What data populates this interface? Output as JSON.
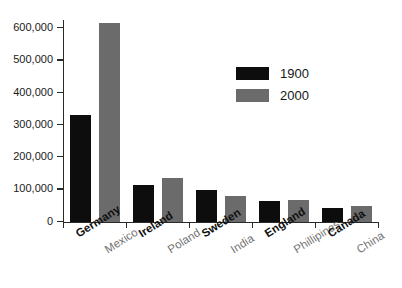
{
  "chart_data": {
    "type": "bar",
    "title": "",
    "subtitle": "",
    "xlabel": "",
    "ylabel": "",
    "ylim": [
      0,
      620000
    ],
    "yticks": [
      0,
      100000,
      200000,
      300000,
      400000,
      500000,
      600000
    ],
    "ytick_labels": [
      "0",
      "100,000",
      "200,000",
      "300,000",
      "400,000",
      "500,000",
      "600,000"
    ],
    "grid": false,
    "legend_position": "upper-center-right",
    "group_count": 5,
    "series": [
      {
        "name": "1900",
        "color": "#0d0d0d",
        "categories": [
          "Germany",
          "Ireland",
          "Sweden",
          "England",
          "Canada"
        ],
        "values": [
          333000,
          114000,
          99000,
          66000,
          42000
        ]
      },
      {
        "name": "2000",
        "color": "#6b6b6b",
        "categories": [
          "Mexico",
          "Poland",
          "India",
          "Phillipines",
          "China"
        ],
        "values": [
          618000,
          137000,
          82000,
          67000,
          50000
        ]
      }
    ],
    "bars": [
      {
        "label": "Germany",
        "series": "1900",
        "value": 333000
      },
      {
        "label": "Mexico",
        "series": "2000",
        "value": 618000
      },
      {
        "label": "Ireland",
        "series": "1900",
        "value": 114000
      },
      {
        "label": "Poland",
        "series": "2000",
        "value": 137000
      },
      {
        "label": "Sweden",
        "series": "1900",
        "value": 99000
      },
      {
        "label": "India",
        "series": "2000",
        "value": 82000
      },
      {
        "label": "England",
        "series": "1900",
        "value": 66000
      },
      {
        "label": "Phillipines",
        "series": "2000",
        "value": 67000
      },
      {
        "label": "Canada",
        "series": "1900",
        "value": 42000
      },
      {
        "label": "China",
        "series": "2000",
        "value": 50000
      }
    ]
  },
  "legend": {
    "items": [
      {
        "label": "1900",
        "color": "#0d0d0d"
      },
      {
        "label": "2000",
        "color": "#6b6b6b"
      }
    ]
  },
  "colors": {
    "series_1900": "#0d0d0d",
    "series_2000": "#6b6b6b",
    "axis": "#2a2a2a",
    "background": "#ffffff"
  }
}
